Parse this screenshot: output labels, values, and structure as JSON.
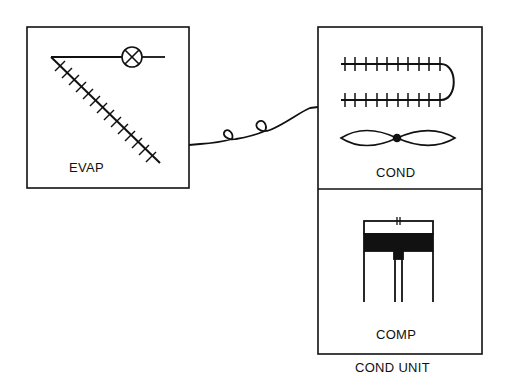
{
  "diagram": {
    "title": "",
    "colors": {
      "ink": "#111111",
      "background": "#ffffff"
    },
    "evaporator": {
      "label": "EVAP",
      "components": [
        "expansion-valve",
        "evaporator-coil"
      ]
    },
    "condensing_unit": {
      "label": "COND UNIT",
      "condenser": {
        "label": "COND",
        "components": [
          "condenser-coil",
          "condenser-fan"
        ]
      },
      "compressor": {
        "label": "COMP",
        "components": [
          "piston-cylinder"
        ]
      }
    },
    "connection": {
      "type": "refrigerant-line",
      "from": "EVAP",
      "to": "COND"
    }
  }
}
